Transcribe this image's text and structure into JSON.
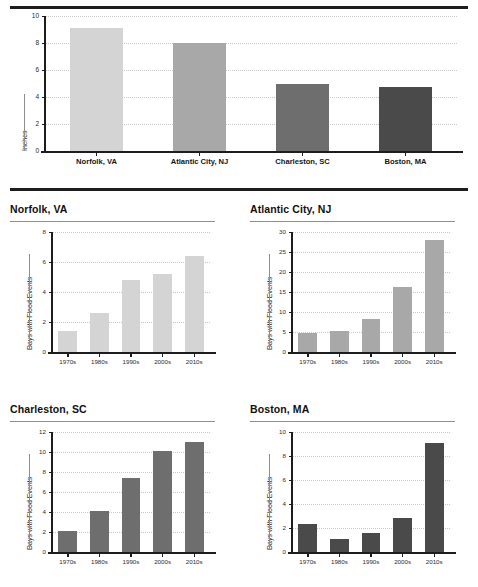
{
  "figure": {
    "title_truncated": true
  },
  "chart_data": [
    {
      "id": "main",
      "type": "bar",
      "title": "",
      "xlabel": "",
      "ylabel": "Inches",
      "ylim": [
        0,
        10
      ],
      "yticks": [
        0,
        2,
        4,
        6,
        8,
        10
      ],
      "grid": true,
      "categories": [
        "Norfolk, VA",
        "Atlantic City, NJ",
        "Charleston, SC",
        "Boston, MA"
      ],
      "values": [
        9.1,
        8.0,
        5.0,
        4.75
      ],
      "colors": [
        "#d4d4d4",
        "#a8a8a8",
        "#6e6e6e",
        "#4a4a4a"
      ]
    },
    {
      "id": "norfolk",
      "type": "bar",
      "title": "Norfolk, VA",
      "xlabel": "",
      "ylabel": "Days with Flood Events",
      "ylim": [
        0,
        8
      ],
      "yticks": [
        0,
        2,
        4,
        6,
        8
      ],
      "grid": true,
      "categories": [
        "1970s",
        "1980s",
        "1990s",
        "2000s",
        "2010s"
      ],
      "values": [
        1.4,
        2.6,
        4.8,
        5.2,
        6.4
      ],
      "color": "#d4d4d4"
    },
    {
      "id": "atlantic-city",
      "type": "bar",
      "title": "Atlantic City, NJ",
      "xlabel": "",
      "ylabel": "Days with Flood Events",
      "ylim": [
        0,
        30
      ],
      "yticks": [
        0,
        5,
        10,
        15,
        20,
        25,
        30
      ],
      "grid": true,
      "categories": [
        "1970s",
        "1980s",
        "1990s",
        "2000s",
        "2010s"
      ],
      "values": [
        4.8,
        5.3,
        8.3,
        16.3,
        28.0
      ],
      "color": "#a8a8a8"
    },
    {
      "id": "charleston",
      "type": "bar",
      "title": "Charleston, SC",
      "xlabel": "",
      "ylabel": "Days with Flood Events",
      "ylim": [
        0,
        12
      ],
      "yticks": [
        0,
        2,
        4,
        6,
        8,
        10,
        12
      ],
      "grid": true,
      "categories": [
        "1970s",
        "1980s",
        "1990s",
        "2000s",
        "2010s"
      ],
      "values": [
        2.1,
        4.1,
        7.4,
        10.1,
        11.0
      ],
      "color": "#6e6e6e"
    },
    {
      "id": "boston",
      "type": "bar",
      "title": "Boston, MA",
      "xlabel": "",
      "ylabel": "Days with Flood Events",
      "ylim": [
        0,
        10
      ],
      "yticks": [
        0,
        2,
        4,
        6,
        8,
        10
      ],
      "grid": true,
      "categories": [
        "1970s",
        "1980s",
        "1990s",
        "2000s",
        "2010s"
      ],
      "values": [
        2.3,
        1.05,
        1.55,
        2.85,
        9.1
      ],
      "color": "#4a4a4a"
    }
  ]
}
